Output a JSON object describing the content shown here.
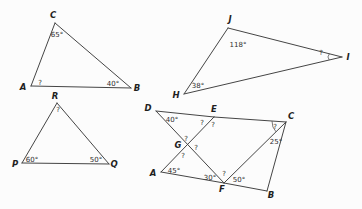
{
  "colors": {
    "background": "#fcfcfc",
    "line": "#454545",
    "text": "#1f1f1f"
  },
  "figure1": {
    "vertices": {
      "A": "A",
      "B": "B",
      "C": "C"
    },
    "angles": {
      "A": "?",
      "B": "40°",
      "C": "65°"
    }
  },
  "figure2": {
    "vertices": {
      "H": "H",
      "I": "I",
      "J": "J"
    },
    "angles": {
      "H": "38°",
      "I": "?",
      "J": "118°"
    }
  },
  "figure3": {
    "vertices": {
      "P": "P",
      "Q": "Q",
      "R": "R"
    },
    "angles": {
      "P": "60°",
      "Q": "50°",
      "R": "?"
    }
  },
  "figure4": {
    "vertices": {
      "A": "A",
      "B": "B",
      "C": "C",
      "D": "D",
      "E": "E",
      "F": "F",
      "G": "G"
    },
    "angles": {
      "D": "40°",
      "E_left": "?",
      "E_right": "?",
      "C_top": "?",
      "C_bottom": "25°",
      "G_top": "?",
      "G_right": "?",
      "G_bottom": "?",
      "A": "45°",
      "F_left": "30°",
      "F_mid": "?",
      "F_right": "50°"
    }
  }
}
